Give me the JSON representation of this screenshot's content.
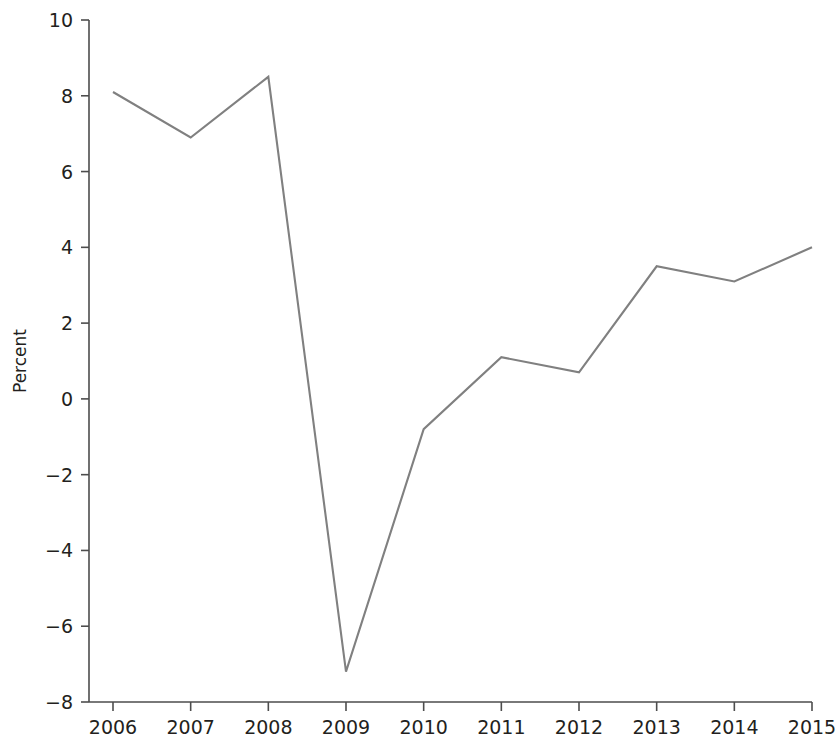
{
  "chart_data": {
    "type": "line",
    "title": "",
    "subtitle": "",
    "xlabel": "",
    "ylabel": "Percent",
    "categories": [
      "2006",
      "2007",
      "2008",
      "2009",
      "2010",
      "2011",
      "2012",
      "2013",
      "2014",
      "2015"
    ],
    "x": [
      2006,
      2007,
      2008,
      2009,
      2010,
      2011,
      2012,
      2013,
      2014,
      2015
    ],
    "values": [
      8.1,
      6.9,
      8.5,
      -7.2,
      -0.8,
      1.1,
      0.7,
      3.5,
      3.1,
      4.0
    ],
    "series": [
      {
        "name": "Percent",
        "values": [
          8.1,
          6.9,
          8.5,
          -7.2,
          -0.8,
          1.1,
          0.7,
          3.5,
          3.1,
          4.0
        ],
        "color": "#808080"
      }
    ],
    "xlim": [
      2006,
      2015
    ],
    "ylim": [
      -8,
      10
    ],
    "ytick_labels": [
      "10",
      "8",
      "6",
      "4",
      "2",
      "0",
      "−2",
      "−4",
      "−6",
      "−8"
    ],
    "ytick_values": [
      10,
      8,
      6,
      4,
      2,
      0,
      -2,
      -4,
      -6,
      -8
    ],
    "xtick_labels": [
      "2006",
      "2007",
      "2008",
      "2009",
      "2010",
      "2011",
      "2012",
      "2013",
      "2014",
      "2015"
    ],
    "grid": false,
    "legend": false,
    "legend_position": "none",
    "line_color": "#808080",
    "axis_color": "#4d4d4d",
    "text_color": "#231f20",
    "background_color": "#ffffff"
  }
}
